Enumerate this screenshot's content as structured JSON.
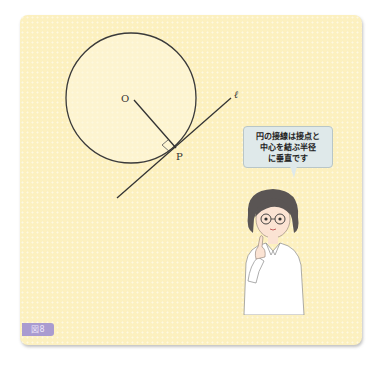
{
  "figure": {
    "tag": "図8",
    "tag_color": "#a99bd0",
    "background_color": "#fcf0bf"
  },
  "diagram": {
    "center_label": "O",
    "point_label": "P",
    "line_label": "ℓ",
    "circle": {
      "cx": 131,
      "cy": 98,
      "r": 65
    },
    "radius_segment": {
      "x1": 134,
      "y1": 100,
      "x2": 176,
      "y2": 148
    },
    "tangent_line": {
      "x1": 117,
      "y1": 198,
      "x2": 231,
      "y2": 98
    },
    "right_angle_marker": true
  },
  "speech_bubble": {
    "lines": [
      "円の接線は接点と",
      "中心を結ぶ半径",
      "に垂直です"
    ],
    "background_color": "#dfe9ea"
  },
  "character": {
    "description": "woman with glasses and bob haircut, white shirt, pointing finger up"
  }
}
